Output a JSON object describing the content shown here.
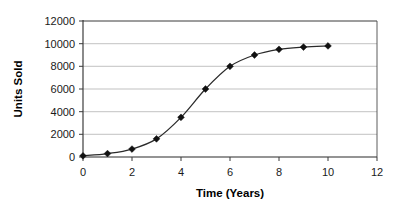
{
  "chart_data": {
    "type": "line",
    "title": "",
    "xlabel": "Time (Years)",
    "ylabel": "Units Sold",
    "x": [
      0,
      1,
      2,
      3,
      4,
      5,
      6,
      7,
      8,
      9,
      10
    ],
    "values": [
      100,
      300,
      700,
      1600,
      3500,
      6000,
      8000,
      9000,
      9500,
      9700,
      9800
    ],
    "series": [
      {
        "name": "Units Sold",
        "x": [
          0,
          1,
          2,
          3,
          4,
          5,
          6,
          7,
          8,
          9,
          10
        ],
        "values": [
          100,
          300,
          700,
          1600,
          3500,
          6000,
          8000,
          9000,
          9500,
          9700,
          9800
        ]
      }
    ],
    "xlim": [
      0,
      12
    ],
    "ylim": [
      0,
      12000
    ],
    "xticks": [
      0,
      2,
      4,
      6,
      8,
      10,
      12
    ],
    "yticks": [
      0,
      2000,
      4000,
      6000,
      8000,
      10000,
      12000
    ],
    "xtick_labels": [
      "0",
      "2",
      "4",
      "6",
      "8",
      "10",
      "12"
    ],
    "ytick_labels": [
      "0",
      "2000",
      "4000",
      "6000",
      "8000",
      "10000",
      "12000"
    ],
    "grid": "horizontal",
    "legend": "none",
    "marker": "diamond",
    "marker_color": "#111111",
    "line_color": "#2a2a2a",
    "gridline_color": "#a8a8a8",
    "plot_background": "#ffffff",
    "annotations": []
  },
  "axes": {
    "y_title": "Units Sold",
    "x_title": "Time (Years)"
  },
  "ytick_labels": {
    "0": "12000",
    "1": "10000",
    "2": "8000",
    "3": "6000",
    "4": "4000",
    "5": "2000",
    "6": "0"
  },
  "xtick_labels": {
    "0": "0",
    "1": "2",
    "2": "4",
    "3": "6",
    "4": "8",
    "5": "10",
    "6": "12"
  }
}
